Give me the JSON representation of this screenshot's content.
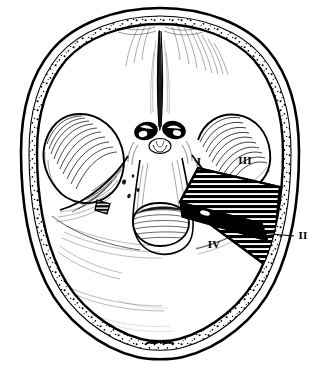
{
  "figure": {
    "view": "superior-axial",
    "style": "pen-and-ink line drawing",
    "background_color": "#ffffff",
    "ink_color": "#000000",
    "width": 320,
    "height": 371
  },
  "labels": [
    {
      "id": "label-1",
      "text": "I",
      "x": 199,
      "y": 162,
      "note": "anterior-medial corner of exposure"
    },
    {
      "id": "label-3",
      "text": "III",
      "x": 245,
      "y": 161,
      "note": "anterior-lateral corner of exposure"
    },
    {
      "id": "label-2",
      "text": "II",
      "x": 303,
      "y": 236,
      "note": "lateral, outside skull outline, leader line"
    },
    {
      "id": "label-4",
      "text": "IV",
      "x": 214,
      "y": 245,
      "note": "posterior-medial corner of exposure"
    }
  ],
  "leader_line": {
    "name": "label-2-leader",
    "x1": 294,
    "y1": 236,
    "x2": 238,
    "y2": 231
  },
  "exposure_region": {
    "name": "hatched-exposure-quadrilateral",
    "fill_pattern": "horizontal-hatch",
    "points": "198,168 280,187 272,270 180,202",
    "band": {
      "name": "solid-diagonal-band",
      "points": "180,202 262,223 268,241 182,217"
    }
  },
  "side_marker": {
    "name": "contralateral-hatched-marker",
    "points": "97,200 110,204 107,214 95,210"
  },
  "skull_outline": {
    "outer": "M160,8 C205,8 246,24 268,50 C289,75 299,110 299,152 C299,200 292,246 274,283 C256,320 220,348 183,357 C170,360 150,360 137,357 C100,348 64,320 46,283 C28,246 21,200 21,152 C21,110 31,75 52,50 C74,24 115,8 160,8 Z",
    "inner": "M160,16 C202,16 240,31 261,55 C281,79 291,112 291,152 C291,198 284,242 267,277 C250,312 216,339 181,348 C169,351 151,351 139,348 C104,339 70,312 53,277 C36,242 29,198 29,152 C29,112 39,79 59,55 C80,31 118,16 160,16 Z",
    "inner_table": "M160,24 C199,24 234,38 254,60 C273,83 283,113 283,152 C283,196 276,238 260,271 C244,304 212,330 179,339 C168,342 152,342 141,339 C108,330 76,304 60,271 C44,238 37,196 37,152 C37,113 47,83 66,60 C86,38 121,24 160,24 Z"
  },
  "anatomy_notes": {
    "crista_galli": "midline frontal groove",
    "anterior_fossa": "paired frontal depressions",
    "sphenoid_ridges": "curved shaded wings",
    "optic_canals": "two dark ovals flanking midline",
    "sella_turcica": "small central pit",
    "petrous_ridges": "oblique shaded ridges",
    "clivus_foramen_magnum": "central posterior oval",
    "posterior_fossa": "large rear compartments",
    "occipital_crest": "midline wavy bump at rear"
  }
}
